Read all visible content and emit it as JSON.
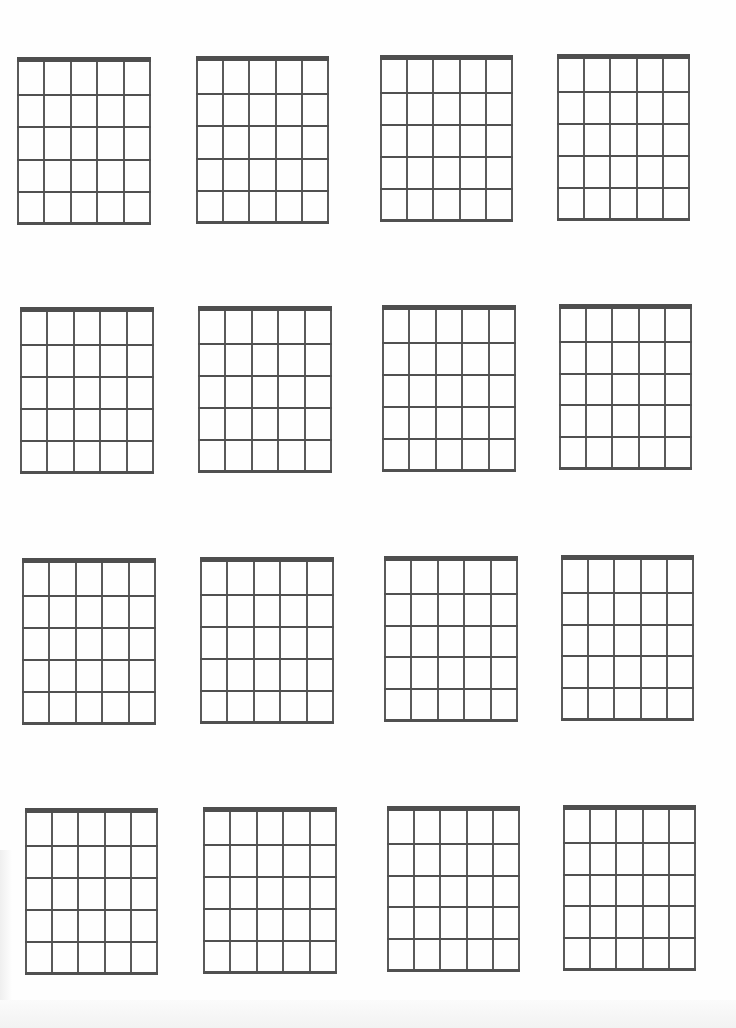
{
  "page": {
    "background": "#fefefe",
    "line_color": "#555555",
    "nut_color": "#4e4e4e"
  },
  "diagram_spec": {
    "strings": 6,
    "frets": 5,
    "nut_thickness_px": 5,
    "line_thickness_px": 2
  },
  "diagrams": [
    {
      "row": 1,
      "col": 1,
      "left": 17,
      "top": 57,
      "right": 151,
      "bottom": 225
    },
    {
      "row": 1,
      "col": 2,
      "left": 196,
      "top": 56,
      "right": 329,
      "bottom": 224
    },
    {
      "row": 1,
      "col": 3,
      "left": 380,
      "top": 55,
      "right": 513,
      "bottom": 222
    },
    {
      "row": 1,
      "col": 4,
      "left": 557,
      "top": 54,
      "right": 690,
      "bottom": 221
    },
    {
      "row": 2,
      "col": 1,
      "left": 20,
      "top": 307,
      "right": 154,
      "bottom": 474
    },
    {
      "row": 2,
      "col": 2,
      "left": 198,
      "top": 306,
      "right": 332,
      "bottom": 473
    },
    {
      "row": 2,
      "col": 3,
      "left": 382,
      "top": 305,
      "right": 516,
      "bottom": 472
    },
    {
      "row": 2,
      "col": 4,
      "left": 559,
      "top": 304,
      "right": 692,
      "bottom": 470
    },
    {
      "row": 3,
      "col": 1,
      "left": 22,
      "top": 558,
      "right": 156,
      "bottom": 725
    },
    {
      "row": 3,
      "col": 2,
      "left": 200,
      "top": 557,
      "right": 334,
      "bottom": 724
    },
    {
      "row": 3,
      "col": 3,
      "left": 384,
      "top": 556,
      "right": 518,
      "bottom": 722
    },
    {
      "row": 3,
      "col": 4,
      "left": 561,
      "top": 555,
      "right": 694,
      "bottom": 721
    },
    {
      "row": 4,
      "col": 1,
      "left": 25,
      "top": 808,
      "right": 158,
      "bottom": 975
    },
    {
      "row": 4,
      "col": 2,
      "left": 203,
      "top": 807,
      "right": 337,
      "bottom": 974
    },
    {
      "row": 4,
      "col": 3,
      "left": 387,
      "top": 806,
      "right": 520,
      "bottom": 972
    },
    {
      "row": 4,
      "col": 4,
      "left": 563,
      "top": 805,
      "right": 696,
      "bottom": 971
    }
  ]
}
